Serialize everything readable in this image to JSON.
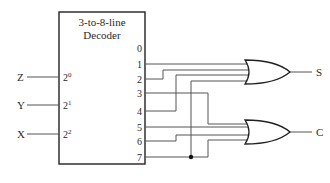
{
  "decoder": {
    "title_line1": "3-to-8-line",
    "title_line2": "Decoder",
    "inputs": [
      {
        "label": "Z",
        "pin": "2",
        "exp": "0"
      },
      {
        "label": "Y",
        "pin": "2",
        "exp": "1"
      },
      {
        "label": "X",
        "pin": "2",
        "exp": "2"
      }
    ],
    "outputs": [
      "0",
      "1",
      "2",
      "3",
      "4",
      "5",
      "6",
      "7"
    ]
  },
  "gates": [
    {
      "type": "OR",
      "output_label": "S",
      "inputs_from": [
        1,
        2,
        4,
        7
      ]
    },
    {
      "type": "OR",
      "output_label": "C",
      "inputs_from": [
        3,
        5,
        6,
        7
      ]
    }
  ],
  "colors": {
    "line": "#555555",
    "text": "#2a2a2a",
    "background": "#ffffff"
  }
}
